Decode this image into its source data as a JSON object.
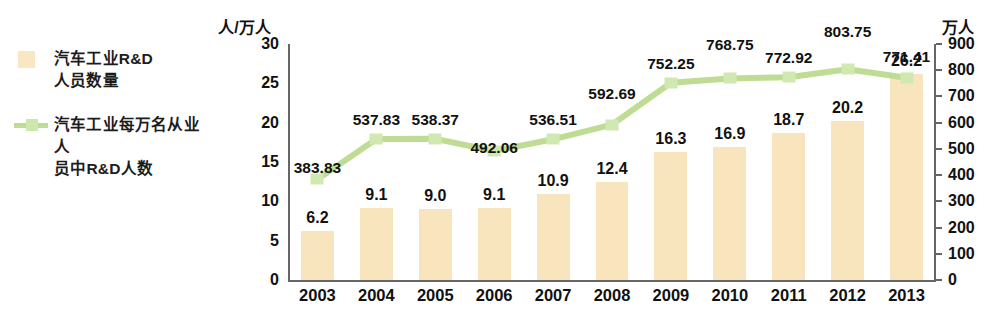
{
  "legend": {
    "entries": [
      {
        "key": "bar-swatch",
        "label": "汽车工业R&D\n人员数量"
      },
      {
        "key": "line-swatch",
        "label": "汽车工业每万名从业人\n员中R&D人数"
      }
    ]
  },
  "axis_titles": {
    "left": "人/万人",
    "right": "万人"
  },
  "chart_data": {
    "type": "bar",
    "title": "",
    "subtitle": "",
    "xlabel": "",
    "ylabel": "人/万人",
    "y2label": "万人",
    "categories": [
      "2003",
      "2004",
      "2005",
      "2006",
      "2007",
      "2008",
      "2009",
      "2010",
      "2011",
      "2012",
      "2013"
    ],
    "ylim": [
      0,
      30
    ],
    "y2lim": [
      0,
      900
    ],
    "yticks": [
      "0",
      "5",
      "10",
      "15",
      "20",
      "25",
      "30"
    ],
    "y2ticks": [
      "0",
      "100",
      "200",
      "300",
      "400",
      "500",
      "600",
      "700",
      "800",
      "900"
    ],
    "grid": false,
    "legend_position": "left-outside",
    "series": [
      {
        "name": "汽车工业R&D人员数量",
        "type": "bar",
        "axis": "left",
        "unit": "人/万人",
        "color": "#f8e4bd",
        "values": [
          6.2,
          9.1,
          9.0,
          9.1,
          10.9,
          12.4,
          16.3,
          16.9,
          18.7,
          20.2,
          26.2
        ],
        "labels": [
          "6.2",
          "9.1",
          "9.0",
          "9.1",
          "10.9",
          "12.4",
          "16.3",
          "16.9",
          "18.7",
          "20.2",
          "26.2"
        ]
      },
      {
        "name": "汽车工业每万名从业人员中R&D人数",
        "type": "line",
        "axis": "right",
        "unit": "万人",
        "color": "#bedc93",
        "values": [
          383.83,
          537.83,
          538.37,
          492.06,
          536.51,
          592.69,
          752.25,
          768.75,
          772.92,
          803.75,
          771.41
        ],
        "labels": [
          "383.83",
          "537.83",
          "538.37",
          "492.06",
          "536.51",
          "592.69",
          "752.25",
          "768.75",
          "772.92",
          "803.75",
          "771.41"
        ]
      }
    ]
  }
}
